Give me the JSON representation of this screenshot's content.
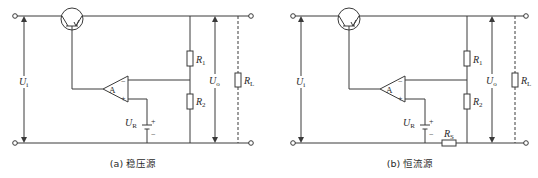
{
  "figure": {
    "panels": [
      {
        "id": "a",
        "caption": "(a) 稳压源",
        "labels": {
          "input_voltage": "U",
          "input_voltage_sub": "i",
          "output_voltage": "U",
          "output_voltage_sub": "o",
          "ref_voltage": "U",
          "ref_voltage_sub": "R",
          "r1": "R",
          "r1_sub": "1",
          "r2": "R",
          "r2_sub": "2",
          "rl": "R",
          "rl_sub": "L",
          "amp": "A",
          "minus": "−",
          "plus": "+",
          "batt_plus": "+",
          "batt_minus": "−"
        }
      },
      {
        "id": "b",
        "caption": "(b) 恒流源",
        "labels": {
          "input_voltage": "U",
          "input_voltage_sub": "i",
          "output_voltage": "U",
          "output_voltage_sub": "o",
          "ref_voltage": "U",
          "ref_voltage_sub": "R",
          "r1": "R",
          "r1_sub": "1",
          "r2": "R",
          "r2_sub": "2",
          "rl": "R",
          "rl_sub": "L",
          "rs": "R",
          "rs_sub": "S",
          "amp": "A",
          "minus": "−",
          "plus": "+",
          "batt_plus": "+",
          "batt_minus": "−"
        }
      }
    ],
    "colors": {
      "line": "#3a3a3a",
      "text": "#2a2a2a",
      "background": "#ffffff"
    }
  }
}
